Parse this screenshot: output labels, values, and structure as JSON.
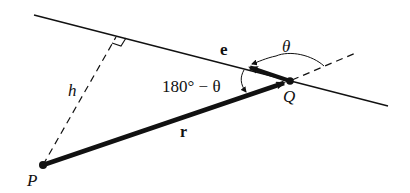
{
  "diagram": {
    "type": "vector-geometry",
    "colors": {
      "ink": "#111111",
      "background": "#ffffff"
    },
    "labels": {
      "P": "P",
      "Q": "Q",
      "r": "r",
      "e": "e",
      "h": "h",
      "theta": "θ",
      "supplement": "180° − θ"
    },
    "elements": [
      {
        "id": "line",
        "kind": "solid-line",
        "from": [
          34,
          15
        ],
        "to": [
          388,
          106
        ]
      },
      {
        "id": "line-extension",
        "kind": "dashed-line",
        "from": [
          290,
          81
        ],
        "to": [
          358,
          52
        ]
      },
      {
        "id": "perpendicular-h",
        "kind": "dashed-line",
        "from": [
          43,
          165
        ],
        "to": [
          116,
          36
        ]
      },
      {
        "id": "vector-r",
        "kind": "arrow",
        "from": [
          43,
          165
        ],
        "to": [
          290,
          81
        ]
      },
      {
        "id": "vector-e",
        "kind": "arrow",
        "from": [
          290,
          81
        ],
        "to": [
          245,
          66
        ]
      },
      {
        "id": "point-P",
        "kind": "point",
        "at": [
          43,
          165
        ]
      },
      {
        "id": "point-Q",
        "kind": "point",
        "at": [
          290,
          81
        ]
      },
      {
        "id": "right-angle-marker",
        "kind": "square",
        "at": [
          116,
          36
        ]
      },
      {
        "id": "angle-theta-arc",
        "kind": "arc-arrow"
      },
      {
        "id": "angle-supplement-arc",
        "kind": "arc-arrow"
      }
    ]
  }
}
